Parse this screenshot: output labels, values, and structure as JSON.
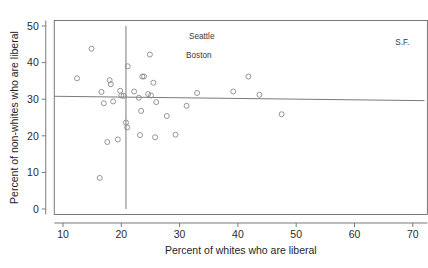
{
  "chart_data": {
    "type": "scatter",
    "title": "",
    "xlabel": "Percent of whites who are liberal",
    "ylabel": "Percent of non-whites who are liberal",
    "xlim": [
      8.5,
      72.5
    ],
    "ylim": [
      -1.5,
      51.5
    ],
    "xticks": [
      10,
      20,
      30,
      40,
      50,
      60,
      70
    ],
    "xtick_labels": [
      "10",
      "20",
      "30",
      "40",
      "50",
      "60",
      "70"
    ],
    "yticks": [
      0,
      10,
      20,
      30,
      40,
      50
    ],
    "ytick_labels": [
      "0",
      "10",
      "20",
      "30",
      "40",
      "50"
    ],
    "grid": false,
    "legend": null,
    "marker": "open-circle",
    "points": [
      {
        "x": 12.4,
        "y": 35.7
      },
      {
        "x": 14.9,
        "y": 43.8
      },
      {
        "x": 16.3,
        "y": 8.5
      },
      {
        "x": 16.6,
        "y": 32.0
      },
      {
        "x": 17.0,
        "y": 28.9
      },
      {
        "x": 17.6,
        "y": 18.3
      },
      {
        "x": 18.0,
        "y": 35.2
      },
      {
        "x": 18.2,
        "y": 34.1
      },
      {
        "x": 18.6,
        "y": 29.4
      },
      {
        "x": 19.4,
        "y": 19.0
      },
      {
        "x": 19.8,
        "y": 32.3
      },
      {
        "x": 20.0,
        "y": 31.0
      },
      {
        "x": 20.4,
        "y": 30.9
      },
      {
        "x": 20.8,
        "y": 23.6
      },
      {
        "x": 21.0,
        "y": 22.3
      },
      {
        "x": 21.1,
        "y": 39.0
      },
      {
        "x": 22.2,
        "y": 32.1
      },
      {
        "x": 23.0,
        "y": 30.4
      },
      {
        "x": 23.2,
        "y": 20.2
      },
      {
        "x": 23.4,
        "y": 26.8
      },
      {
        "x": 23.6,
        "y": 36.2
      },
      {
        "x": 23.9,
        "y": 36.2
      },
      {
        "x": 24.6,
        "y": 31.4
      },
      {
        "x": 24.9,
        "y": 42.2
      },
      {
        "x": 25.1,
        "y": 31.0
      },
      {
        "x": 25.5,
        "y": 34.5
      },
      {
        "x": 25.8,
        "y": 19.6
      },
      {
        "x": 26.0,
        "y": 29.2
      },
      {
        "x": 27.8,
        "y": 25.4
      },
      {
        "x": 29.3,
        "y": 20.3
      },
      {
        "x": 31.2,
        "y": 28.2
      },
      {
        "x": 33.0,
        "y": 31.7
      },
      {
        "x": 39.2,
        "y": 32.1
      },
      {
        "x": 41.8,
        "y": 36.2
      },
      {
        "x": 43.7,
        "y": 31.2
      },
      {
        "x": 47.5,
        "y": 25.9
      }
    ],
    "regression_line": {
      "x_start": 8.5,
      "y_start": 30.8,
      "x_end": 72.0,
      "y_end": 29.6,
      "description": "near-flat fitted line"
    },
    "vertical_reference_line": {
      "x": 20.8,
      "y_start": 0.0,
      "y_end": 50.0
    },
    "annotations": [
      {
        "label": "Seattle",
        "x": 33.8,
        "y": 46.5
      },
      {
        "label": "Boston",
        "x": 33.3,
        "y": 41.3
      },
      {
        "label": "S.F.",
        "x": 68.2,
        "y": 44.9
      }
    ]
  }
}
